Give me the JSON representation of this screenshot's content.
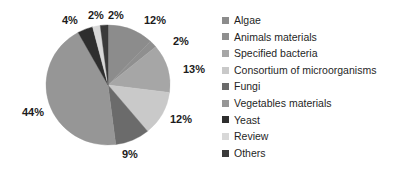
{
  "chart_data": {
    "type": "pie",
    "title": "",
    "subtitle": "",
    "xlabel": "",
    "ylabel": "",
    "legend_position": "right",
    "grid": false,
    "start_angle_deg": 0,
    "direction": "clockwise",
    "categories": [
      "Algae",
      "Animals materials",
      "Specified bacteria",
      "Consortium of microorganisms",
      "Fungi",
      "Vegetables materials",
      "Yeast",
      "Review",
      "Others"
    ],
    "values": [
      12,
      2,
      13,
      12,
      9,
      44,
      4,
      2,
      2
    ],
    "data_labels": [
      "12%",
      "2%",
      "13%",
      "12%",
      "9%",
      "44%",
      "4%",
      "2%",
      "2%"
    ],
    "colors": [
      "#8c8c8c",
      "#8f8f8f",
      "#a6a6a6",
      "#c9c9c9",
      "#6b6b6b",
      "#969696",
      "#2e2e2e",
      "#d8d8d8",
      "#3a3a3a"
    ],
    "total": 100,
    "units": "percent"
  },
  "legend": {
    "items": [
      {
        "label": "Algae",
        "color": "#8c8c8c",
        "value": "12%"
      },
      {
        "label": "Animals materials",
        "color": "#8f8f8f",
        "value": "2%"
      },
      {
        "label": "Specified bacteria",
        "color": "#a6a6a6",
        "value": "13%"
      },
      {
        "label": "Consortium of microorganisms",
        "color": "#c9c9c9",
        "value": "12%"
      },
      {
        "label": "Fungi",
        "color": "#6b6b6b",
        "value": "9%"
      },
      {
        "label": "Vegetables materials",
        "color": "#969696",
        "value": "44%"
      },
      {
        "label": "Yeast",
        "color": "#2e2e2e",
        "value": "4%"
      },
      {
        "label": "Review",
        "color": "#d8d8d8",
        "value": "2%"
      },
      {
        "label": "Others",
        "color": "#3a3a3a",
        "value": "2%"
      }
    ]
  },
  "pie_labels": [
    {
      "text": "12%",
      "x": 144,
      "y": 14
    },
    {
      "text": "2%",
      "x": 173,
      "y": 35
    },
    {
      "text": "13%",
      "x": 183,
      "y": 63
    },
    {
      "text": "12%",
      "x": 170,
      "y": 113
    },
    {
      "text": "9%",
      "x": 122,
      "y": 148
    },
    {
      "text": "44%",
      "x": 22,
      "y": 106
    },
    {
      "text": "4%",
      "x": 62,
      "y": 14
    },
    {
      "text": "2%",
      "x": 88,
      "y": 9
    },
    {
      "text": "2%",
      "x": 108,
      "y": 9
    }
  ],
  "style": {
    "background": "#ffffff",
    "text_color": "#1c1c1c"
  }
}
